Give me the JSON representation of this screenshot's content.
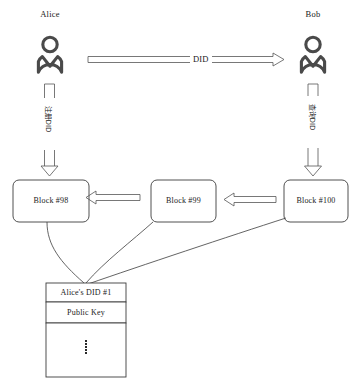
{
  "diagram": {
    "background": "#ffffff",
    "stroke_color": "#3c3c3c",
    "icon_color": "#4a4a4a",
    "text_color": "#1a1a1a"
  },
  "actors": [
    {
      "id": "alice",
      "name": "Alice",
      "icon": "person-icon"
    },
    {
      "id": "bob",
      "name": "Bob",
      "icon": "person-icon"
    }
  ],
  "flows": {
    "horizontal": {
      "label": "DID",
      "direction": "alice-to-bob",
      "style": "hollow-block-arrow"
    },
    "alice_to_chain": {
      "label": "注册DID",
      "direction": "down",
      "style": "hollow-block-arrow"
    },
    "bob_to_chain": {
      "label": "查询DID",
      "direction": "down",
      "style": "hollow-block-arrow"
    }
  },
  "blocks": [
    {
      "id": "block98",
      "label": "Block  #98"
    },
    {
      "id": "block99",
      "label": "Block  #99"
    },
    {
      "id": "block100",
      "label": "Block  #100"
    }
  ],
  "chain_links": [
    {
      "from": "block99",
      "to": "block98",
      "style": "hollow-arrow-left"
    },
    {
      "from": "block100",
      "to": "block99",
      "style": "hollow-arrow-left"
    }
  ],
  "did_document": {
    "rows": [
      {
        "id": "did-row",
        "text": "Alice's DID #1"
      },
      {
        "id": "public-key-row",
        "text": "Public Key"
      },
      {
        "id": "more-row",
        "text": "",
        "icon": "vertical-ellipsis-icon"
      }
    ]
  }
}
